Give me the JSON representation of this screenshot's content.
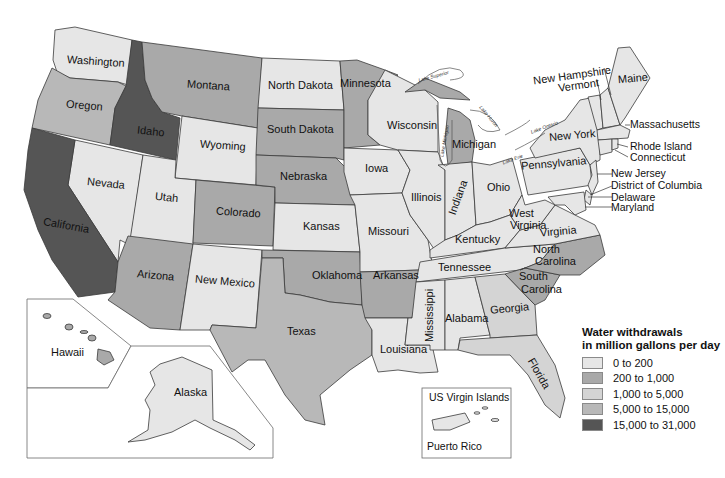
{
  "legend": {
    "title_line1": "Water withdrawals",
    "title_line2": "in million gallons per day",
    "items": [
      {
        "label": "0 to 200",
        "color": "#e6e6e6"
      },
      {
        "label": "200 to 1,000",
        "color": "#a9a9a9"
      },
      {
        "label": "1,000 to 5,000",
        "color": "#d4d4d4"
      },
      {
        "label": "5,000 to 15,000",
        "color": "#b8b8b8"
      },
      {
        "label": "15,000 to 31,000",
        "color": "#555555"
      }
    ]
  },
  "states": {
    "washington": "Washington",
    "oregon": "Oregon",
    "idaho": "Idaho",
    "montana": "Montana",
    "wyoming": "Wyoming",
    "nevada": "Nevada",
    "utah": "Utah",
    "california": "California",
    "colorado": "Colorado",
    "arizona": "Arizona",
    "new_mexico": "New Mexico",
    "north_dakota": "North Dakota",
    "south_dakota": "South Dakota",
    "nebraska": "Nebraska",
    "kansas": "Kansas",
    "oklahoma": "Oklahoma",
    "texas": "Texas",
    "minnesota": "Minnesota",
    "iowa": "Iowa",
    "missouri": "Missouri",
    "arkansas": "Arkansas",
    "louisiana": "Louisiana",
    "wisconsin": "Wisconsin",
    "illinois": "Illinois",
    "michigan": "Michigan",
    "indiana": "Indiana",
    "ohio": "Ohio",
    "kentucky": "Kentucky",
    "tennessee": "Tennessee",
    "mississippi": "Mississippi",
    "alabama": "Alabama",
    "georgia": "Georgia",
    "florida": "Florida",
    "south_carolina_1": "South",
    "south_carolina_2": "Carolina",
    "north_carolina_1": "North",
    "north_carolina_2": "Carolina",
    "virginia": "Virginia",
    "west_virginia_1": "West",
    "west_virginia_2": "Virginia",
    "pennsylvania": "Pennsylvania",
    "new_york": "New York",
    "maine": "Maine",
    "new_hampshire": "New Hampshire",
    "vermont": "Vermont",
    "massachusetts": "Massachusetts",
    "rhode_island": "Rhode Island",
    "connecticut": "Connecticut",
    "new_jersey": "New Jersey",
    "dc": "District of Columbia",
    "delaware": "Delaware",
    "maryland": "Maryland",
    "hawaii": "Hawaii",
    "alaska": "Alaska",
    "us_virgin_islands": "US Virgin Islands",
    "puerto_rico": "Puerto Rico"
  },
  "lakes": {
    "superior": "Lake Superior",
    "michigan": "Lake Michigan",
    "huron": "Lake Huron",
    "ontario": "Lake Ontario",
    "erie": "Lake Erie"
  }
}
